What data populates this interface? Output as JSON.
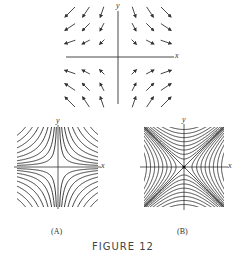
{
  "figure": {
    "caption": "FIGURE 12",
    "vector_field": {
      "x_label": "x",
      "y_label": "y",
      "description": "saddle vector field F = (x, -y)",
      "grid_cols": [
        -3,
        -2,
        -1,
        1,
        2,
        3
      ],
      "grid_rows": [
        3,
        2,
        1,
        -1,
        -2,
        -3
      ]
    },
    "panel_a": {
      "label": "(A)",
      "x_label": "x",
      "y_label": "y",
      "description": "hyperbolas xy = c (asymptotes on axes)"
    },
    "panel_b": {
      "label": "(B)",
      "x_label": "x",
      "y_label": "y",
      "description": "hyperbolas x^2 - y^2 = c with asymptotes y = ±x"
    }
  },
  "colors": {
    "ink": "#2a2a2a",
    "background": "#ffffff"
  }
}
